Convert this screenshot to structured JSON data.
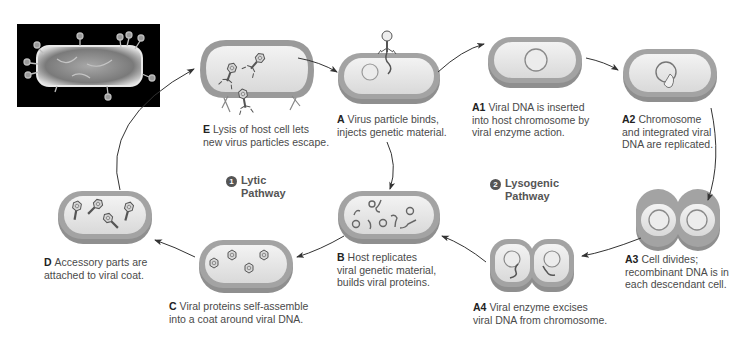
{
  "photo": {
    "alt": "Electron micrograph of bacteriophages attached to a bacterium"
  },
  "pathways": {
    "lytic": {
      "number": "1",
      "line1": "Lytic",
      "line2": "Pathway"
    },
    "lysogenic": {
      "number": "2",
      "line1": "Lysogenic",
      "line2": "Pathway"
    }
  },
  "steps": {
    "A": {
      "label": "A",
      "line1": "Virus particle binds,",
      "line2": "injects genetic material."
    },
    "A1": {
      "label": "A1",
      "line1": "Viral DNA is inserted",
      "line2": "into host chromosome by",
      "line3": "viral enzyme action."
    },
    "A2": {
      "label": "A2",
      "line1": "Chromosome",
      "line2": "and integrated viral",
      "line3": "DNA are replicated."
    },
    "A3": {
      "label": "A3",
      "line1": "Cell divides;",
      "line2": "recombinant DNA is in",
      "line3": "each descendant cell."
    },
    "A4": {
      "label": "A4",
      "line1": "Viral enzyme excises",
      "line2": "viral DNA from chromosome."
    },
    "B": {
      "label": "B",
      "line1": "Host replicates",
      "line2": "viral genetic material,",
      "line3": "builds viral proteins."
    },
    "C": {
      "label": "C",
      "line1": "Viral proteins self-assemble",
      "line2": "into a coat around viral DNA."
    },
    "D": {
      "label": "D",
      "line1": "Accessory parts are",
      "line2": "attached to viral coat."
    },
    "E": {
      "label": "E",
      "line1": "Lysis of host cell lets",
      "line2": "new virus particles escape."
    }
  },
  "colors": {
    "cell_wall": "#9a9a9a",
    "cell_wall_dark": "#7d7d7d",
    "cytoplasm": "#e6e6e6",
    "dna": "#6e6e6e",
    "arrow": "#333333"
  }
}
